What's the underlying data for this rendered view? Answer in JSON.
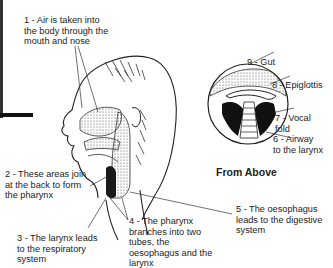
{
  "diagram": {
    "title_view": "From Above",
    "labels": [
      {
        "id": 1,
        "text": "1 - Air is taken into\nthe body through the\nmouth and nose"
      },
      {
        "id": 2,
        "text": "2 - These areas join\nat the back to form\nthe pharynx"
      },
      {
        "id": 3,
        "text": "3 - The larynx leads\nto the respiratory\nsystem"
      },
      {
        "id": 4,
        "text": "4 - The pharynx\nbranches into two\ntubes, the\noesophagus and the\nlarynx"
      },
      {
        "id": 5,
        "text": "5 - The oesophagus\nleads to the digestive\nsystem"
      },
      {
        "id": 6,
        "text": "6 - Airway\nto the larynx"
      },
      {
        "id": 7,
        "text": "7 - Vocal\nfold"
      },
      {
        "id": 8,
        "text": "8 - Epiglottis"
      },
      {
        "id": 9,
        "text": "9 - Gut"
      }
    ]
  }
}
